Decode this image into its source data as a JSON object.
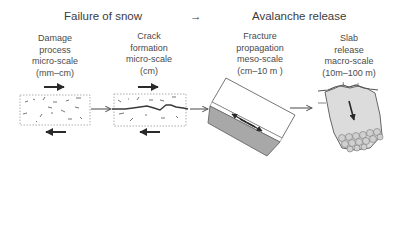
{
  "header": {
    "left": "Failure of snow",
    "arrow": "→",
    "right": "Avalanche release"
  },
  "stages": [
    {
      "lines": [
        "Damage",
        "process",
        "micro-scale",
        "(mm–cm)"
      ]
    },
    {
      "lines": [
        "Crack",
        "formation",
        "micro-scale",
        "(cm)"
      ]
    },
    {
      "lines": [
        "Fracture",
        "propagation",
        "meso-scale",
        "(cm–10 m )"
      ]
    },
    {
      "lines": [
        "Slab",
        "release",
        "macro-scale",
        "(10m–100 m)"
      ]
    }
  ],
  "colors": {
    "text": "#3c3c3c",
    "arrow": "#2a2a2a",
    "dotted_border": "#9a9a9a",
    "slab_top_fill": "#ffffff",
    "weak_layer_fill": "#a8a8a8",
    "slab_release_fill": "#dcdcdc",
    "debris_fill": "#d0d0d0"
  }
}
